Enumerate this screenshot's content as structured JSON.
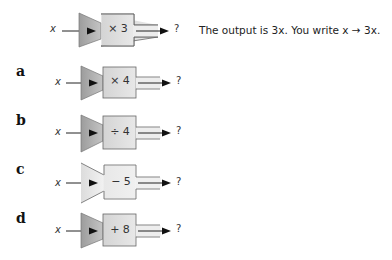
{
  "example": {
    "input": "x",
    "operation": "× 3",
    "output": "?",
    "explanation": "The output is 3x. You write x → 3x.",
    "funnel_style": "dark"
  },
  "exercises": [
    {
      "letter": "a",
      "input": "x",
      "operation": "× 4",
      "output": "?",
      "funnel_style": "dark"
    },
    {
      "letter": "b",
      "input": "x",
      "operation": "÷ 4",
      "output": "?",
      "funnel_style": "dark"
    },
    {
      "letter": "c",
      "input": "x",
      "operation": "− 5",
      "output": "?",
      "funnel_style": "light"
    },
    {
      "letter": "d",
      "input": "x",
      "operation": "+ 8",
      "output": "?",
      "funnel_style": "dark"
    }
  ],
  "colors": {
    "funnel_dark": "#a9a9a9",
    "funnel_light": "#e4e4e4",
    "box_fill": "#e2e2e2",
    "stroke": "#555555",
    "arrow": "#111111"
  }
}
